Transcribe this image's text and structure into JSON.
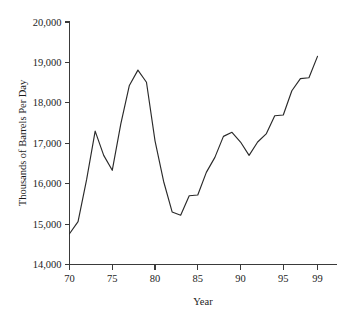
{
  "chart_data": {
    "type": "line",
    "title": "",
    "xlabel": "Year",
    "ylabel": "Thousands of Barrels Per Day",
    "xlim": [
      70,
      99
    ],
    "ylim": [
      14000,
      20000
    ],
    "grid": false,
    "legend": "none",
    "xtick_labels": [
      "70",
      "75",
      "80",
      "85",
      "90",
      "95",
      "99"
    ],
    "xtick_values": [
      70,
      75,
      80,
      85,
      90,
      95,
      99
    ],
    "ytick_labels": [
      "14,000",
      "15,000",
      "16,000",
      "17,000",
      "18,000",
      "19,000",
      "20,000"
    ],
    "ytick_values": [
      14000,
      15000,
      16000,
      17000,
      18000,
      19000,
      20000
    ],
    "x": [
      70,
      71,
      72,
      73,
      74,
      75,
      76,
      77,
      78,
      79,
      80,
      81,
      82,
      83,
      84,
      85,
      86,
      87,
      88,
      89,
      90,
      91,
      92,
      93,
      94,
      95,
      96,
      97,
      98,
      99
    ],
    "values": [
      14760,
      15060,
      16100,
      17300,
      16700,
      16330,
      17480,
      18430,
      18810,
      18510,
      17060,
      16060,
      15300,
      15220,
      15700,
      15720,
      16280,
      16650,
      17170,
      17270,
      17030,
      16700,
      17030,
      17230,
      17680,
      17700,
      18300,
      18600,
      18620,
      19150
    ],
    "series": [
      {
        "name": "Petroleum Products Supplied",
        "values": [
          14760,
          15060,
          16100,
          17300,
          16700,
          16330,
          17480,
          18430,
          18810,
          18510,
          17060,
          16060,
          15300,
          15220,
          15700,
          15720,
          16280,
          16650,
          17170,
          17270,
          17030,
          16700,
          17030,
          17230,
          17680,
          17700,
          18300,
          18600,
          18620,
          19150
        ]
      }
    ]
  }
}
